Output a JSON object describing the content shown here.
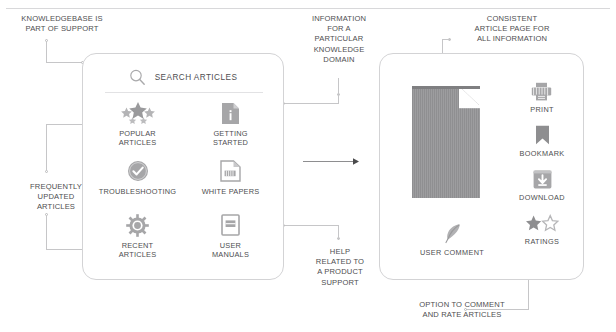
{
  "diagram": {
    "accent": "#8c8c8e",
    "line_color": "#c6c6c8",
    "text_color": "#4e4e50"
  },
  "annotations": [
    {
      "id": "kb-part-of-support",
      "text": "KNOWLEDGEBASE IS\nPART OF SUPPORT"
    },
    {
      "id": "frequently-updated",
      "text": "FREQUENTLY\nUPDATED\nARTICLES"
    },
    {
      "id": "information-domain",
      "text": "INFORMATION\nFOR A\nPARTICULAR\nKNOWLEDGE\nDOMAIN"
    },
    {
      "id": "help-product-support",
      "text": "HELP\nRELATED TO\nA PRODUCT\nSUPPORT"
    },
    {
      "id": "consistent-article-page",
      "text": "CONSISTENT\nARTICLE PAGE FOR\nALL INFORMATION"
    },
    {
      "id": "option-comment-rate",
      "text": "OPTION TO COMMENT\nAND RATE ARTICLES"
    }
  ],
  "left_panel": {
    "search": {
      "icon": "search-icon",
      "label": "SEARCH ARTICLES"
    },
    "tiles": [
      {
        "id": "popular-articles",
        "icon": "stars-icon",
        "label": "POPULAR\nARTICLES"
      },
      {
        "id": "getting-started",
        "icon": "document-info-icon",
        "label": "GETTING\nSTARTED"
      },
      {
        "id": "troubleshooting",
        "icon": "check-badge-icon",
        "label": "TROUBLESHOOTING"
      },
      {
        "id": "white-papers",
        "icon": "document-text-icon",
        "label": "WHITE PAPERS"
      },
      {
        "id": "recent-articles",
        "icon": "gear-burst-icon",
        "label": "RECENT\nARTICLES"
      },
      {
        "id": "user-manuals",
        "icon": "book-icon",
        "label": "USER\nMANUALS"
      }
    ]
  },
  "right_panel": {
    "article_preview": {
      "icon": "document-page-icon"
    },
    "actions": [
      {
        "id": "print",
        "icon": "printer-icon",
        "label": "PRINT"
      },
      {
        "id": "bookmark",
        "icon": "bookmark-icon",
        "label": "BOOKMARK"
      },
      {
        "id": "download",
        "icon": "download-icon",
        "label": "DOWNLOAD"
      },
      {
        "id": "ratings",
        "icon": "stars-rating-icon",
        "label": "RATINGS"
      }
    ],
    "comment": {
      "icon": "feather-icon",
      "label": "USER COMMENT"
    }
  }
}
